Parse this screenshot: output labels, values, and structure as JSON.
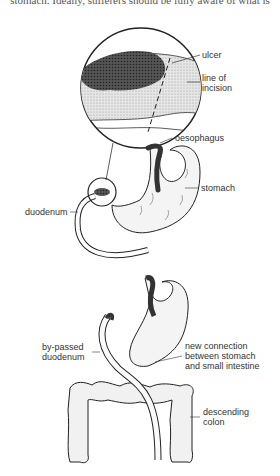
{
  "page": {
    "top_text": "stomach. Ideally, sufferers should be fully aware of what is"
  },
  "diagram": {
    "labels": {
      "ulcer": "ulcer",
      "line_of_incision_1": "line of",
      "line_of_incision_2": "incision",
      "oesophagus": "oesophagus",
      "stomach": "stomach",
      "duodenum": "duodenum",
      "bypassed_duodenum_1": "by-passed",
      "bypassed_duodenum_2": "duodenum",
      "new_connection_1": "new connection",
      "new_connection_2": "between stomach",
      "new_connection_3": "and small intestine",
      "descending_colon_1": "descending",
      "descending_colon_2": "colon"
    }
  }
}
